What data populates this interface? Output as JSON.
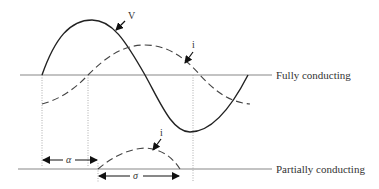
{
  "diagram": {
    "labels": {
      "voltage": "V",
      "current_top": "i",
      "current_bottom": "i",
      "alpha": "α",
      "sigma": "σ",
      "fully_conducting": "Fully conducting",
      "partially_conducting": "Partially conducting"
    },
    "colors": {
      "stroke": "#222222",
      "axis": "#888888",
      "dotted": "#999999",
      "text": "#333333"
    }
  }
}
